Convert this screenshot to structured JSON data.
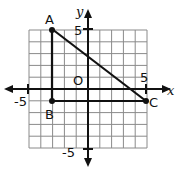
{
  "diagram": {
    "type": "coordinate-plane-triangle",
    "grid": {
      "xmin": -5,
      "xmax": 5,
      "ymin": -5,
      "ymax": 5,
      "step": 1
    },
    "axes": {
      "x_label": "x",
      "y_label": "y",
      "origin_label": "O"
    },
    "tick_labels": {
      "x_neg": "-5",
      "x_pos": "5",
      "y_pos": "5",
      "y_neg": "-5"
    },
    "points": [
      {
        "name": "A",
        "x": -3,
        "y": 5
      },
      {
        "name": "B",
        "x": -3,
        "y": -1
      },
      {
        "name": "C",
        "x": 5,
        "y": -1
      }
    ],
    "segments": [
      [
        "A",
        "B"
      ],
      [
        "B",
        "C"
      ],
      [
        "A",
        "C"
      ]
    ],
    "colors": {
      "grid": "#8a8a8a",
      "ink": "#111111"
    }
  }
}
